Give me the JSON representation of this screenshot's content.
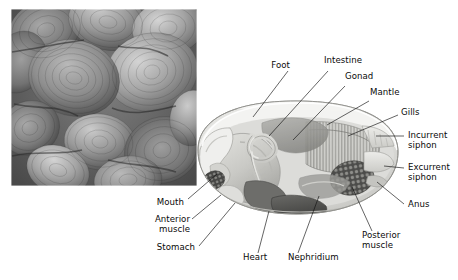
{
  "figure": {
    "type": "labeled-anatomical-diagram",
    "background_color": "#ffffff",
    "photo": {
      "name": "clam-shells-photograph",
      "description": "black and white photograph of a pile of clam shells",
      "rect": {
        "x": 11,
        "y": 9,
        "width": 186,
        "height": 177
      },
      "palette": [
        "#3a3a3a",
        "#555555",
        "#6e6e6e",
        "#888888",
        "#a2a2a2",
        "#bcbcbc",
        "#d6d6d6"
      ]
    },
    "diagram": {
      "name": "clam-internal-anatomy-illustration",
      "description": "cutaway illustration of clam internal anatomy",
      "rect": {
        "x": 192,
        "y": 100,
        "width": 208,
        "height": 138
      },
      "colors": {
        "mantle": "#e9e9e6",
        "shell_edge": "#d2d2cf",
        "foot": "#cfcfcb",
        "gills": "#c8c8c4",
        "gonad": "#9b9b97",
        "stomach": "#6f6f6c",
        "intestine": "#b4b4b0",
        "heart": "#4f4f4d",
        "muscle": "#5c5c5a",
        "siphon": "#dcdcd9",
        "outline": "#8a8a86"
      }
    },
    "labels": [
      {
        "id": "foot",
        "text": "Foot",
        "align": "right",
        "x": 290,
        "y": 66
      },
      {
        "id": "intestine",
        "text": "Intestine",
        "align": "left",
        "x": 324,
        "y": 61
      },
      {
        "id": "gonad",
        "text": "Gonad",
        "align": "left",
        "x": 345,
        "y": 77
      },
      {
        "id": "mantle",
        "text": "Mantle",
        "align": "left",
        "x": 370,
        "y": 93
      },
      {
        "id": "gills",
        "text": "Gills",
        "align": "left",
        "x": 400,
        "y": 112
      },
      {
        "id": "incurrent-siphon",
        "text": "Incurrent\nsiphon",
        "align": "left",
        "x": 408,
        "y": 131
      },
      {
        "id": "excurrent-siphon",
        "text": "Excurrent\nsiphon",
        "align": "left",
        "x": 408,
        "y": 163
      },
      {
        "id": "anus",
        "text": "Anus",
        "align": "left",
        "x": 408,
        "y": 203
      },
      {
        "id": "posterior-muscle",
        "text": "Posterior\nmuscle",
        "align": "left",
        "x": 362,
        "y": 235
      },
      {
        "id": "nephridium",
        "text": "Nephridium",
        "align": "left",
        "x": 288,
        "y": 258
      },
      {
        "id": "heart",
        "text": "Heart",
        "align": "left",
        "x": 248,
        "y": 258
      },
      {
        "id": "stomach",
        "text": "Stomach",
        "align": "right",
        "x": 195,
        "y": 250
      },
      {
        "id": "anterior-muscle",
        "text": "Anterior\nmuscle",
        "align": "right",
        "x": 190,
        "y": 220
      },
      {
        "id": "mouth",
        "text": "Mouth",
        "align": "right",
        "x": 184,
        "y": 203
      }
    ],
    "leader_lines": [
      {
        "id": "foot-leader",
        "from": [
          288,
          71
        ],
        "to": [
          253,
          117
        ]
      },
      {
        "id": "intestine-leader",
        "from": [
          328,
          71
        ],
        "to": [
          269,
          136
        ]
      },
      {
        "id": "gonad-leader",
        "from": [
          345,
          86
        ],
        "to": [
          293,
          140
        ]
      },
      {
        "id": "mantle-leader",
        "from": [
          369,
          101
        ],
        "to": [
          327,
          125
        ]
      },
      {
        "id": "gills-leader",
        "from": [
          398,
          115
        ],
        "to": [
          348,
          136
        ]
      },
      {
        "id": "incurrent-siphon-leader",
        "from": [
          400,
          136
        ],
        "to": [
          376,
          136
        ]
      },
      {
        "id": "excurrent-siphon-leader",
        "from": [
          400,
          168
        ],
        "to": [
          382,
          168
        ]
      },
      {
        "id": "anus-leader",
        "from": [
          404,
          205
        ],
        "to": [
          375,
          181
        ]
      },
      {
        "id": "posterior-muscle-leader",
        "from": [
          372,
          231
        ],
        "to": [
          352,
          189
        ]
      },
      {
        "id": "nephridium-leader",
        "from": [
          298,
          253
        ],
        "to": [
          317,
          197
        ]
      },
      {
        "id": "heart-leader",
        "from": [
          258,
          253
        ],
        "to": [
          268,
          211
        ]
      },
      {
        "id": "stomach-leader",
        "from": [
          199,
          246
        ],
        "to": [
          233,
          204
        ]
      },
      {
        "id": "anterior-muscle-leader",
        "from": [
          192,
          219
        ],
        "to": [
          219,
          196
        ]
      },
      {
        "id": "mouth-leader",
        "from": [
          188,
          199
        ],
        "to": [
          217,
          174
        ]
      }
    ]
  }
}
